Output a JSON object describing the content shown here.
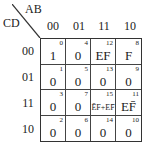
{
  "kmap": {
    "col_var": "AB",
    "row_var": "CD",
    "col_headers": [
      "00",
      "01",
      "11",
      "10"
    ],
    "row_headers": [
      "00",
      "01",
      "11",
      "10"
    ],
    "cells": [
      [
        {
          "index": "0",
          "value": "1"
        },
        {
          "index": "4",
          "value": "0"
        },
        {
          "index": "12",
          "value": "EF"
        },
        {
          "index": "8",
          "value": "F"
        }
      ],
      [
        {
          "index": "1",
          "value": "0"
        },
        {
          "index": "5",
          "value": "0"
        },
        {
          "index": "13",
          "value": "0"
        },
        {
          "index": "9",
          "value": "0"
        }
      ],
      [
        {
          "index": "3",
          "value": "0"
        },
        {
          "index": "7",
          "value": "0"
        },
        {
          "index": "15",
          "value": "ĒF+EF̄"
        },
        {
          "index": "11",
          "value": "EF̄"
        }
      ],
      [
        {
          "index": "2",
          "value": "0"
        },
        {
          "index": "6",
          "value": "0"
        },
        {
          "index": "14",
          "value": "0"
        },
        {
          "index": "10",
          "value": "0"
        }
      ]
    ]
  }
}
